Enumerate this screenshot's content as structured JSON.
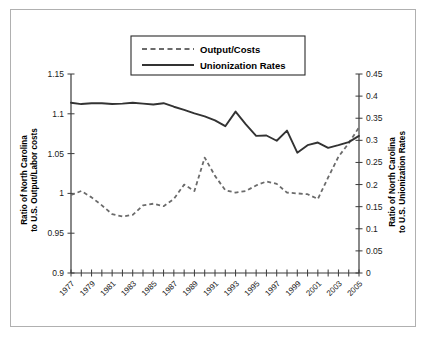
{
  "chart_data": {
    "type": "line",
    "title": "",
    "xlabel": "",
    "ylabel": "Ratio of North Carolina to U.S. Output/Labor costs",
    "y2label": "Ratio of North Carolina to U.S. Unionization Rates",
    "grid": false,
    "legend_position": "top-center",
    "x": [
      1977,
      1978,
      1979,
      1980,
      1981,
      1982,
      1983,
      1984,
      1985,
      1986,
      1987,
      1988,
      1989,
      1990,
      1991,
      1992,
      1993,
      1994,
      1995,
      1996,
      1997,
      1998,
      1999,
      2000,
      2001,
      2002,
      2003,
      2004,
      2005
    ],
    "xtick_labels": [
      "1977",
      "1979",
      "1981",
      "1983",
      "1985",
      "1987",
      "1989",
      "1991",
      "1993",
      "1995",
      "1997",
      "1999",
      "2001",
      "2003",
      "2005"
    ],
    "xlim": [
      1977,
      2005
    ],
    "ylim": [
      0.9,
      1.15
    ],
    "ytick_labels": [
      "0.9",
      "0.95",
      "1",
      "1.05",
      "1.1",
      "1.15"
    ],
    "ytick_values": [
      0.9,
      0.95,
      1.0,
      1.05,
      1.1,
      1.15
    ],
    "y2lim": [
      0,
      0.45
    ],
    "y2tick_labels": [
      "0",
      "0.05",
      "0.1",
      "0.15",
      "0.2",
      "0.25",
      "0.3",
      "0.35",
      "0.4",
      "0.45"
    ],
    "y2tick_values": [
      0,
      0.05,
      0.1,
      0.15,
      0.2,
      0.25,
      0.3,
      0.35,
      0.4,
      0.45
    ],
    "series": [
      {
        "name": "Output/Costs",
        "axis": "left",
        "style": "dashed",
        "color": "#6b6b6b",
        "values": [
          0.998,
          1.003,
          0.995,
          0.985,
          0.974,
          0.971,
          0.973,
          0.985,
          0.987,
          0.984,
          0.993,
          1.011,
          1.003,
          1.045,
          1.022,
          1.004,
          1.001,
          1.003,
          1.01,
          1.015,
          1.012,
          1.001,
          1.0,
          0.999,
          0.993,
          1.02,
          1.046,
          1.063,
          1.083
        ]
      },
      {
        "name": "Unionization Rates",
        "axis": "right",
        "style": "solid",
        "color": "#333333",
        "values": [
          0.385,
          0.382,
          0.384,
          0.384,
          0.382,
          0.383,
          0.385,
          0.383,
          0.381,
          0.384,
          0.376,
          0.369,
          0.361,
          0.354,
          0.345,
          0.332,
          0.365,
          0.336,
          0.31,
          0.311,
          0.299,
          0.322,
          0.272,
          0.289,
          0.295,
          0.283,
          0.289,
          0.296,
          0.31
        ]
      }
    ]
  },
  "legend": {
    "items": [
      {
        "label": "Output/Costs",
        "style": "dashed"
      },
      {
        "label": "Unionization Rates",
        "style": "solid"
      }
    ]
  },
  "axes": {
    "left_title_line1": "Ratio of North Carolina",
    "left_title_line2": "to U.S. Output/Labor costs",
    "right_title_line1": "Ratio of North Carolina",
    "right_title_line2": "to U.S. Unionization Rates"
  }
}
